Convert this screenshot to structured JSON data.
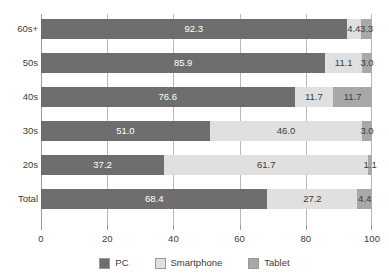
{
  "chart_data": {
    "type": "bar",
    "orientation": "horizontal",
    "stacked": true,
    "stacked_percent": true,
    "title": "",
    "subtitle": "",
    "xlabel": "",
    "ylabel": "",
    "xlim": [
      0,
      100
    ],
    "xticks": [
      0,
      20,
      40,
      60,
      80,
      100
    ],
    "xtick_labels": [
      "0",
      "20",
      "40",
      "60",
      "80",
      "100"
    ],
    "grid": true,
    "grid_axis": "x",
    "legend_position": "bottom",
    "categories": [
      "60s+",
      "50s",
      "40s",
      "30s",
      "20s",
      "Total"
    ],
    "series": [
      {
        "name": "PC",
        "color": "#6e6e6e",
        "values": [
          92.3,
          85.9,
          76.6,
          51.0,
          37.2,
          68.4
        ],
        "labels": [
          "92.3",
          "85.9",
          "76.6",
          "51.0",
          "37.2",
          "68.4"
        ]
      },
      {
        "name": "Smartphone",
        "color": "#e0e0e0",
        "values": [
          4.4,
          11.1,
          11.7,
          46.0,
          61.7,
          27.2
        ],
        "labels": [
          "4.4",
          "11.1",
          "11.7",
          "46.0",
          "61.7",
          "27.2"
        ]
      },
      {
        "name": "Tablet",
        "color": "#a8a8a8",
        "values": [
          3.3,
          3.0,
          11.7,
          3.0,
          1.1,
          4.4
        ],
        "labels": [
          "3.3",
          "3.0",
          "11.7",
          "3.0",
          "1.1",
          "4.4"
        ]
      }
    ]
  },
  "legend": {
    "items": [
      {
        "label": "PC",
        "color": "#6e6e6e"
      },
      {
        "label": "Smartphone",
        "color": "#e0e0e0"
      },
      {
        "label": "Tablet",
        "color": "#a8a8a8"
      }
    ]
  },
  "colors": {
    "pc": "#6e6e6e",
    "smartphone": "#e0e0e0",
    "tablet": "#a8a8a8",
    "axis": "#9a9a9a",
    "grid": "#b9b9b9",
    "text": "#3c3c3c",
    "background": "#ffffff"
  }
}
